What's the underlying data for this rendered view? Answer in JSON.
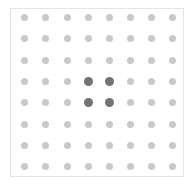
{
  "grid": {
    "rows": 8,
    "cols": 8,
    "col_positions": [
      24,
      45,
      67,
      88,
      109,
      130,
      151,
      172
    ],
    "row_positions": [
      17,
      38,
      60,
      81,
      102,
      124,
      145,
      166
    ],
    "selected_cells": [
      [
        3,
        3
      ],
      [
        3,
        4
      ],
      [
        4,
        3
      ],
      [
        4,
        4
      ]
    ],
    "colors": {
      "dot": "#c9c9c9",
      "selected_dot": "#737373",
      "border": "#e4e4e4"
    }
  }
}
